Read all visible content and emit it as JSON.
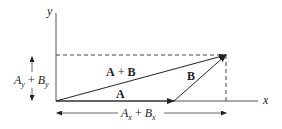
{
  "diagram": {
    "type": "vector-addition",
    "axes": {
      "x_label": "x",
      "y_label": "y"
    },
    "vectors": [
      {
        "name": "A",
        "label": "A",
        "from": [
          0,
          0
        ],
        "to": "A_x"
      },
      {
        "name": "B",
        "label": "B",
        "from": "tip of A",
        "to": "tip of A+B"
      },
      {
        "name": "A+B",
        "label": "A + B",
        "from": [
          0,
          0
        ],
        "to": "(A_x+B_x, A_y+B_y)"
      }
    ],
    "labels": {
      "vec_A": "A",
      "vec_B": "B",
      "vec_sum_A": "A",
      "vec_sum_plus": " + ",
      "vec_sum_B": "B",
      "x_component": {
        "a": "A",
        "a_sub": "x",
        "plus": " + ",
        "b": "B",
        "b_sub": "x"
      },
      "y_component": {
        "a": "A",
        "a_sub": "y",
        "plus": " + ",
        "b": "B",
        "b_sub": "y"
      }
    },
    "colors": {
      "line": "#333333",
      "text": "#222222"
    }
  }
}
